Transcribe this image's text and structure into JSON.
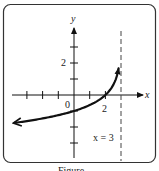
{
  "chart_data": {
    "type": "line",
    "title": "",
    "xlabel": "x",
    "ylabel": "y",
    "function_description": "y = -log_3(3 - x), increasing, with vertical asymptote x = 3",
    "series": [
      {
        "name": "f(x)",
        "x": [
          -3.8,
          -3,
          -2,
          -1,
          0,
          1,
          2,
          2.5,
          2.85
        ],
        "y": [
          -1.74,
          -1.63,
          -1.46,
          -1.26,
          -1.0,
          -0.63,
          0.0,
          0.63,
          1.73
        ]
      }
    ],
    "asymptote": {
      "x": 3,
      "label": "x = 3",
      "style": "dashed"
    },
    "x_ticks": [
      -3,
      -2,
      -1,
      0,
      1,
      2
    ],
    "y_ticks": [
      -3,
      -2,
      -1,
      0,
      1,
      2,
      3
    ],
    "tick_labels": {
      "origin": "0",
      "x": "2",
      "y": "2"
    },
    "xlim": [
      -4,
      4.3
    ],
    "ylim": [
      -4,
      4
    ],
    "grid": false,
    "arrow_left_end": true
  },
  "caption": "Figure"
}
